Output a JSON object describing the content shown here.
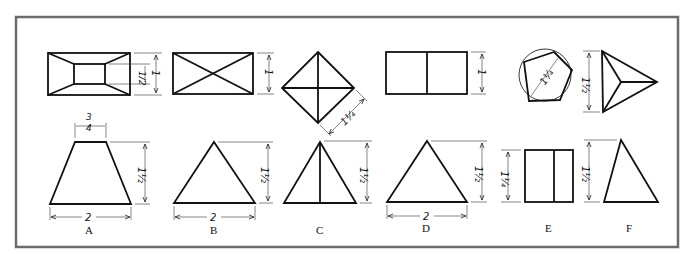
{
  "figure": {
    "frame_color": "#6b6b6b",
    "line_color": "#111111",
    "background": "#ffffff"
  },
  "problems": [
    {
      "label": "A",
      "top_view": "rectangle with inner rectangle (frustum)",
      "front_view": "trapezoid",
      "dims": {
        "top_width": "3/4",
        "height": "1 1/2",
        "base": "2",
        "top_view_inner": "1/2",
        "top_view_outer": "1"
      }
    },
    {
      "label": "B",
      "top_view": "rectangle with diagonals",
      "front_view": "triangle",
      "dims": {
        "depth": "1",
        "height": "1 1/2",
        "base": "2"
      }
    },
    {
      "label": "C",
      "top_view": "square rotated 45° with diagonals",
      "front_view": "triangle with center line",
      "dims": {
        "side": "1 1/4",
        "height": "1 1/2"
      }
    },
    {
      "label": "D",
      "top_view": "rectangle divided vertically",
      "front_view": "triangle",
      "dims": {
        "depth": "1",
        "height": "1 1/2",
        "base": "2"
      }
    },
    {
      "label": "E",
      "top_view": "pentagon inscribed in circle",
      "front_view": "rectangle divided vertically",
      "dims": {
        "across": "1 1/4",
        "height": "1 1/4"
      }
    },
    {
      "label": "F",
      "top_view": "triangle with lines to center",
      "front_view": "triangle",
      "dims": {
        "depth": "1 1/2",
        "height": "1 1/2"
      }
    }
  ],
  "labels": {
    "A": "A",
    "B": "B",
    "C": "C",
    "D": "D",
    "E": "E",
    "F": "F"
  },
  "dim_text": {
    "two": "2",
    "one": "1",
    "three_quarter_num": "3",
    "three_quarter_den": "4",
    "one_half_whole": "1",
    "half_num": "1",
    "half_den": "2",
    "one_quarter_whole": "1",
    "quarter_num": "1",
    "quarter_den": "4",
    "half_only": "1/2"
  }
}
